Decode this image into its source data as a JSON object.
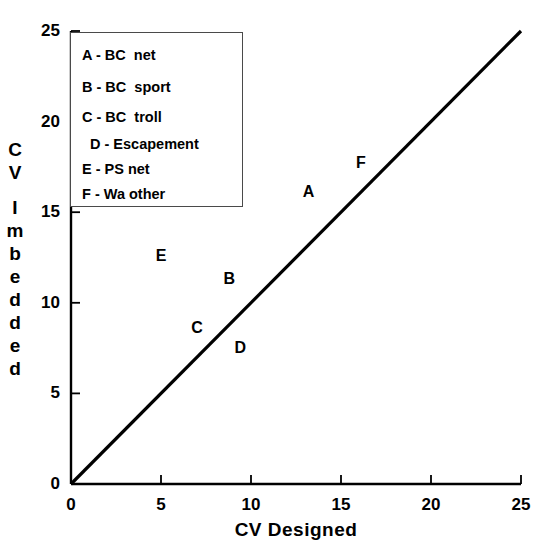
{
  "chart_data": {
    "type": "scatter",
    "title": "",
    "xlabel": "CV Designed",
    "ylabel": "CV Imbedded",
    "xlim": [
      0,
      25
    ],
    "ylim": [
      0,
      25
    ],
    "xticks": [
      "0",
      "5",
      "10",
      "15",
      "20",
      "25"
    ],
    "yticks": [
      "0",
      "5",
      "10",
      "15",
      "20",
      "25"
    ],
    "xtick_values": [
      0,
      5,
      10,
      15,
      20,
      25
    ],
    "ytick_values": [
      0,
      5,
      10,
      15,
      20,
      25
    ],
    "grid": false,
    "legend_position": "upper-left-inside",
    "marker_style": "letter-label",
    "points": [
      {
        "label": "A",
        "x": 13.2,
        "y": 16.1,
        "name": "BC  net"
      },
      {
        "label": "B",
        "x": 8.8,
        "y": 11.3,
        "name": "BC  sport"
      },
      {
        "label": "C",
        "x": 7.0,
        "y": 8.6,
        "name": "BC  troll"
      },
      {
        "label": "D",
        "x": 9.4,
        "y": 7.5,
        "name": "Escapement"
      },
      {
        "label": "E",
        "x": 5.0,
        "y": 12.6,
        "name": "PS net"
      },
      {
        "label": "F",
        "x": 16.1,
        "y": 17.7,
        "name": "Wa other"
      }
    ],
    "reference_line": {
      "name": "one-to-one-line",
      "from": [
        0,
        0
      ],
      "to": [
        25,
        25
      ],
      "style": "solid",
      "color": "#000000"
    },
    "legend_entries": [
      "A - BC  net",
      "B - BC  sport",
      "C - BC  troll",
      "D - Escapement",
      "E - PS net",
      "F - Wa other"
    ],
    "colors": {
      "axis": "#000000",
      "line": "#000000",
      "text": "#000000",
      "legend_border": "#4a4a4a",
      "background": "#ffffff"
    }
  },
  "y_axis_title_chars": [
    "C",
    "V",
    "",
    "I",
    "m",
    "b",
    "e",
    "d",
    "d",
    "e",
    "d"
  ]
}
